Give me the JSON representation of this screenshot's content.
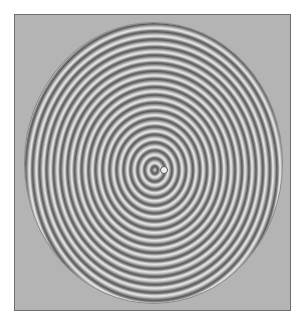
{
  "figure": {
    "frame_color": "#b4b4b4",
    "border_color": "#6e6e6e",
    "ring_dark": "#5a5a5a",
    "ring_light": "#e6e6e6",
    "ring_count": 19
  }
}
